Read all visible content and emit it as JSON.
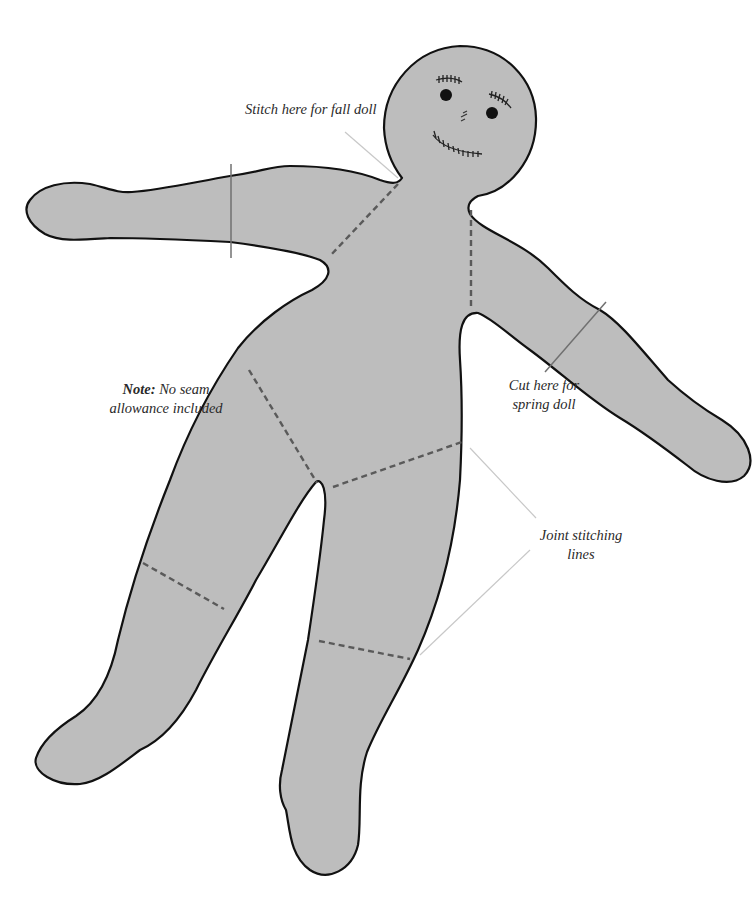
{
  "diagram": {
    "colors": {
      "fill": "#bdbdbd",
      "outline": "#111111",
      "stitch": "#5a5a5a",
      "leader": "#c8c8c8",
      "cut_line": "#707070"
    },
    "labels": {
      "fall_stitch": "Stitch here for fall doll",
      "note_bold": "Note:",
      "note_rest_line1": "No seam",
      "note_line2": "allowance included",
      "spring_cut_line1": "Cut here for",
      "spring_cut_line2": "spring doll",
      "joint_line1": "Joint stitching",
      "joint_line2": "lines"
    },
    "parts": {
      "head": "head",
      "face": [
        "left-eye",
        "right-eye",
        "left-eyebrow-stitches",
        "right-eyebrow-stitches",
        "nose-stitches",
        "mouth-stitches"
      ],
      "limbs": [
        "left-arm",
        "right-arm",
        "left-leg",
        "right-leg"
      ]
    }
  }
}
